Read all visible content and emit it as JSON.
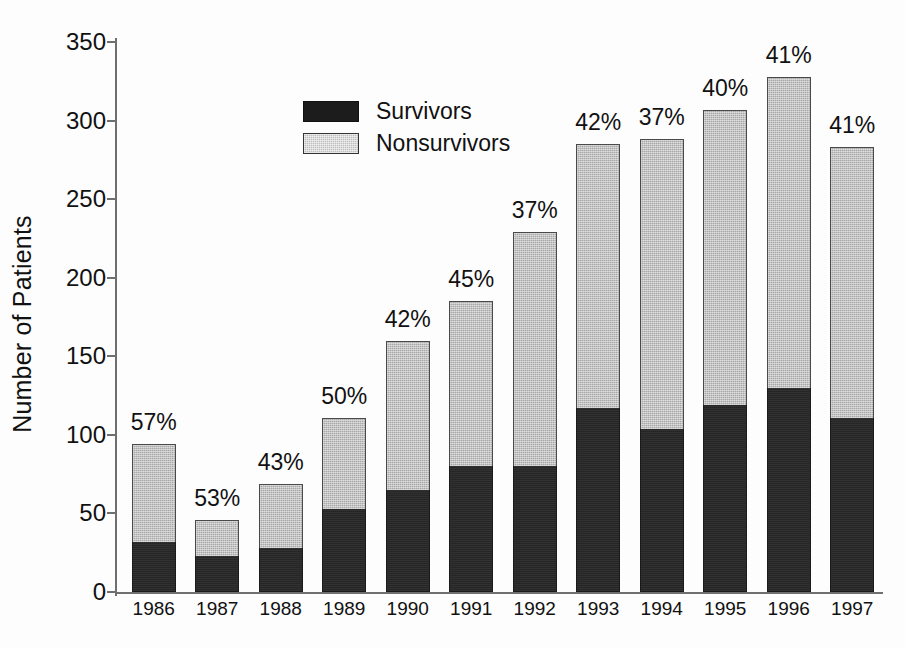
{
  "chart_data": {
    "type": "bar",
    "title": "",
    "subtitle": "",
    "xlabel": "",
    "ylabel": "Number of Patients",
    "stacked": true,
    "grid": false,
    "legend_position": "top-left inside plot",
    "ylim": [
      0,
      350
    ],
    "yticks": [
      0,
      50,
      100,
      150,
      200,
      250,
      300,
      350
    ],
    "ytick_labels": [
      "0",
      "50",
      "100",
      "150",
      "200",
      "250",
      "300",
      "350"
    ],
    "categories": [
      "1986",
      "1987",
      "1988",
      "1989",
      "1990",
      "1991",
      "1992",
      "1993",
      "1994",
      "1995",
      "1996",
      "1997"
    ],
    "series": [
      {
        "name": "Survivors",
        "color": "#262626",
        "values": [
          32,
          23,
          28,
          53,
          65,
          80,
          80,
          117,
          104,
          119,
          130,
          111
        ]
      },
      {
        "name": "Nonsurvivors",
        "color": "#a8a8a8",
        "values": [
          62,
          23,
          41,
          58,
          95,
          105,
          149,
          168,
          184,
          188,
          198,
          172
        ]
      }
    ],
    "totals": [
      94,
      46,
      69,
      111,
      160,
      185,
      229,
      285,
      288,
      307,
      328,
      283
    ],
    "annotations": {
      "description": "Percentage label above each bar",
      "values": [
        "57%",
        "53%",
        "43%",
        "50%",
        "42%",
        "45%",
        "37%",
        "42%",
        "37%",
        "40%",
        "41%",
        "41%"
      ]
    }
  },
  "legend": {
    "items": [
      {
        "label": "Survivors",
        "swatch": "solid-black-swatch"
      },
      {
        "label": "Nonsurvivors",
        "swatch": "gray-hatched-swatch"
      }
    ]
  }
}
